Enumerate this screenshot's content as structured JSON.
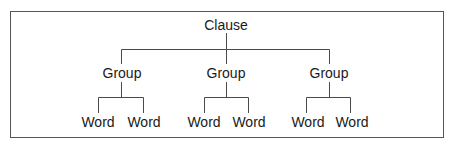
{
  "diagram": {
    "type": "tree",
    "root": {
      "label": "Clause",
      "children": [
        {
          "label": "Group",
          "children": [
            {
              "label": "Word"
            },
            {
              "label": "Word"
            }
          ]
        },
        {
          "label": "Group",
          "children": [
            {
              "label": "Word"
            },
            {
              "label": "Word"
            }
          ]
        },
        {
          "label": "Group",
          "children": [
            {
              "label": "Word"
            },
            {
              "label": "Word"
            }
          ]
        }
      ]
    },
    "colors": {
      "line": "#4a4a4a",
      "text": "#1a1a1a",
      "border": "#555555",
      "background": "#ffffff"
    }
  }
}
